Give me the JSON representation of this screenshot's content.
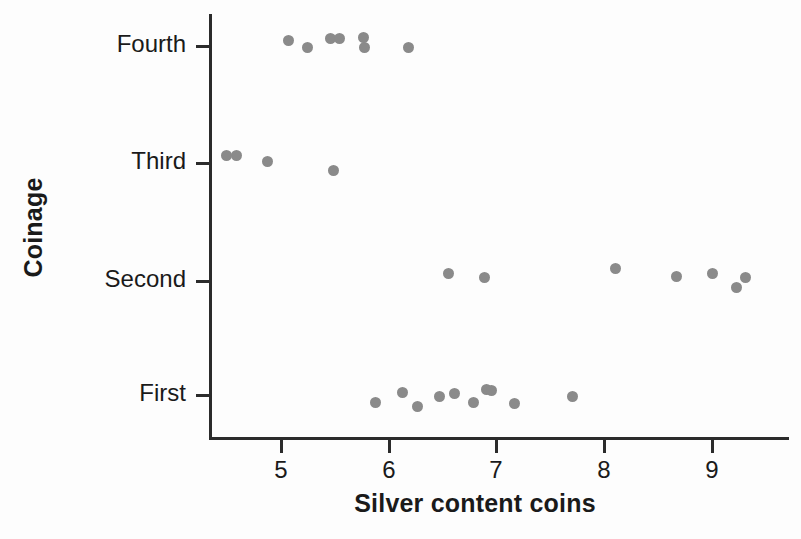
{
  "chart_data": {
    "type": "scatter",
    "title": "",
    "xlabel": "Silver content coins",
    "ylabel": "Coinage",
    "xlim": [
      4.35,
      9.72
    ],
    "ylim_categories": [
      "First",
      "Second",
      "Third",
      "Fourth"
    ],
    "xticks": [
      5,
      6,
      7,
      8,
      9
    ],
    "xtick_labels": [
      "5",
      "6",
      "7",
      "8",
      "9"
    ],
    "yticks": [
      "First",
      "Second",
      "Third",
      "Fourth"
    ],
    "grid": false,
    "legend": false,
    "marker_color": "#8a8a8a",
    "axis_color": "#2b2b2b",
    "series": [
      {
        "name": "Fourth",
        "category": "Fourth",
        "values": [
          5.06,
          5.24,
          5.45,
          5.53,
          5.76,
          5.77,
          6.18
        ]
      },
      {
        "name": "Third",
        "category": "Third",
        "values": [
          4.49,
          4.58,
          4.87,
          5.48
        ]
      },
      {
        "name": "Second",
        "category": "Second",
        "values": [
          6.55,
          6.88,
          8.1,
          8.67,
          9.0,
          9.22,
          9.3
        ]
      },
      {
        "name": "First",
        "category": "First",
        "values": [
          5.87,
          6.12,
          6.26,
          6.46,
          6.6,
          6.78,
          6.9,
          6.95,
          7.16,
          7.7
        ]
      }
    ],
    "points": [
      {
        "x": 5.06,
        "y": "Fourth",
        "px": 288,
        "py": 40
      },
      {
        "x": 5.24,
        "y": "Fourth",
        "px": 307,
        "py": 47
      },
      {
        "x": 5.45,
        "y": "Fourth",
        "px": 330,
        "py": 38
      },
      {
        "x": 5.53,
        "y": "Fourth",
        "px": 339,
        "py": 38
      },
      {
        "x": 5.76,
        "y": "Fourth",
        "px": 363,
        "py": 37
      },
      {
        "x": 5.77,
        "y": "Fourth",
        "px": 364,
        "py": 47
      },
      {
        "x": 6.18,
        "y": "Fourth",
        "px": 408,
        "py": 47
      },
      {
        "x": 4.49,
        "y": "Third",
        "px": 226,
        "py": 155
      },
      {
        "x": 4.58,
        "y": "Third",
        "px": 236,
        "py": 155
      },
      {
        "x": 4.87,
        "y": "Third",
        "px": 267,
        "py": 161
      },
      {
        "x": 5.48,
        "y": "Third",
        "px": 333,
        "py": 170
      },
      {
        "x": 6.55,
        "y": "Second",
        "px": 448,
        "py": 273
      },
      {
        "x": 6.88,
        "y": "Second",
        "px": 484,
        "py": 277
      },
      {
        "x": 8.1,
        "y": "Second",
        "px": 615,
        "py": 268
      },
      {
        "x": 8.67,
        "y": "Second",
        "px": 676,
        "py": 276
      },
      {
        "x": 9.0,
        "y": "Second",
        "px": 712,
        "py": 273
      },
      {
        "x": 9.22,
        "y": "Second",
        "px": 736,
        "py": 287
      },
      {
        "x": 9.3,
        "y": "Second",
        "px": 745,
        "py": 277
      },
      {
        "x": 5.87,
        "y": "First",
        "px": 375,
        "py": 402
      },
      {
        "x": 6.12,
        "y": "First",
        "px": 402,
        "py": 392
      },
      {
        "x": 6.26,
        "y": "First",
        "px": 417,
        "py": 406
      },
      {
        "x": 6.46,
        "y": "First",
        "px": 439,
        "py": 396
      },
      {
        "x": 6.6,
        "y": "First",
        "px": 454,
        "py": 393
      },
      {
        "x": 6.78,
        "y": "First",
        "px": 473,
        "py": 402
      },
      {
        "x": 6.9,
        "y": "First",
        "px": 486,
        "py": 389
      },
      {
        "x": 6.95,
        "y": "First",
        "px": 491,
        "py": 390
      },
      {
        "x": 7.16,
        "y": "First",
        "px": 514,
        "py": 403
      },
      {
        "x": 7.7,
        "y": "First",
        "px": 572,
        "py": 396
      }
    ]
  },
  "axes": {
    "y_title": "Coinage",
    "x_title": "Silver content coins",
    "y_tick_labels": [
      {
        "label": "Fourth",
        "py": 46
      },
      {
        "label": "Third",
        "py": 163
      },
      {
        "label": "Second",
        "py": 281
      },
      {
        "label": "First",
        "py": 395
      }
    ],
    "x_tick_labels": [
      {
        "label": "5",
        "px": 281
      },
      {
        "label": "6",
        "px": 389
      },
      {
        "label": "7",
        "px": 496
      },
      {
        "label": "8",
        "px": 604
      },
      {
        "label": "9",
        "px": 712
      }
    ]
  }
}
